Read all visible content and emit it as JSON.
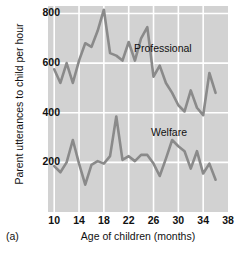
{
  "caption": "(a)",
  "chart_data": {
    "type": "line",
    "title": "",
    "xlabel": "Age of children (months)",
    "ylabel": "Parent utterances to child per hour",
    "xlim": [
      9,
      38
    ],
    "ylim": [
      0,
      830
    ],
    "xticks": [
      10,
      14,
      18,
      22,
      26,
      30,
      34,
      38
    ],
    "yticks": [
      200,
      400,
      600,
      800
    ],
    "grid": true,
    "grid_color": "#ffffff",
    "panel_background": "#d2d2d2",
    "line_color": "#8a8a8a",
    "legend": "inline-annotation",
    "series": [
      {
        "name": "Professional",
        "label_x": 27.5,
        "label_y": 655,
        "x": [
          10,
          11,
          12,
          13,
          14,
          15,
          16,
          17,
          18,
          19,
          20,
          21,
          22,
          23,
          24,
          25,
          26,
          27,
          28,
          29,
          30,
          31,
          32,
          33,
          34,
          35,
          36
        ],
        "values": [
          575,
          520,
          600,
          520,
          610,
          680,
          665,
          730,
          815,
          640,
          630,
          610,
          685,
          610,
          700,
          745,
          545,
          590,
          520,
          480,
          430,
          405,
          490,
          420,
          390,
          560,
          480
        ]
      },
      {
        "name": "Welfare",
        "label_x": 28.5,
        "label_y": 318,
        "x": [
          10,
          11,
          12,
          13,
          14,
          15,
          16,
          17,
          18,
          19,
          20,
          21,
          22,
          23,
          24,
          25,
          26,
          27,
          28,
          29,
          30,
          31,
          32,
          33,
          34,
          35,
          36
        ],
        "values": [
          185,
          160,
          200,
          290,
          195,
          110,
          190,
          205,
          195,
          225,
          385,
          210,
          225,
          205,
          230,
          230,
          195,
          145,
          215,
          290,
          265,
          245,
          175,
          245,
          155,
          195,
          130
        ]
      }
    ]
  }
}
